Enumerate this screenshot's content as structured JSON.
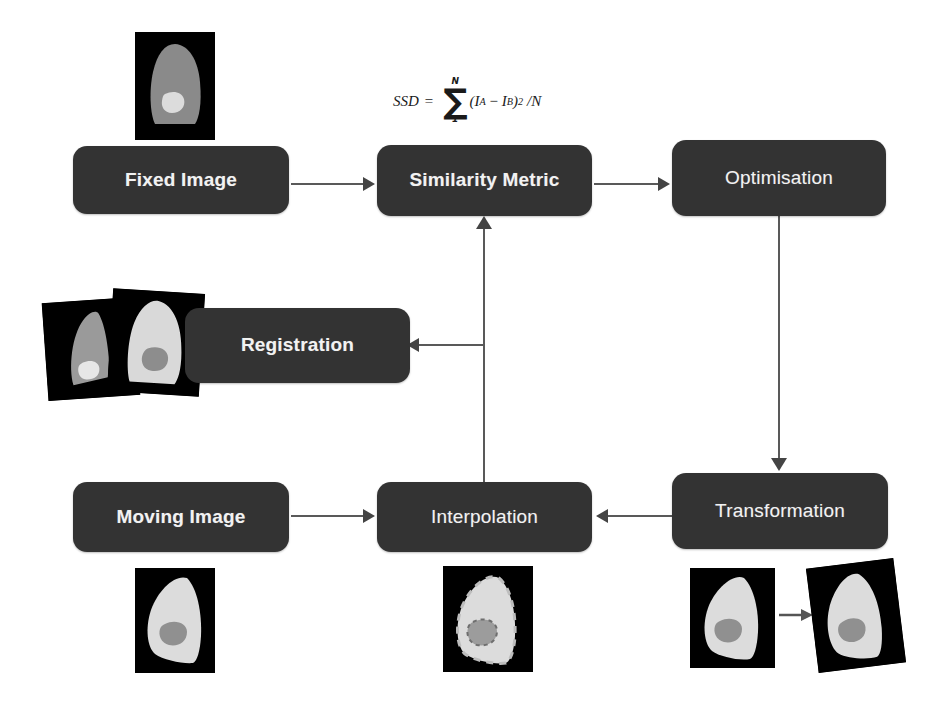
{
  "diagram": {
    "box_color": "#333333",
    "text_color": "#f2f2f2",
    "connector_color": "#595959",
    "background": "#ffffff"
  },
  "nodes": [
    {
      "id": "fixed",
      "label": "Fixed Image"
    },
    {
      "id": "similarity",
      "label": "Similarity Metric"
    },
    {
      "id": "optimisation",
      "label": "Optimisation"
    },
    {
      "id": "registration",
      "label": "Registration"
    },
    {
      "id": "moving",
      "label": "Moving Image"
    },
    {
      "id": "interpolation",
      "label": "Interpolation"
    },
    {
      "id": "transformation",
      "label": "Transformation"
    }
  ],
  "formula": {
    "lhs": "SSD",
    "equals": "=",
    "sigma": "∑",
    "upper_limit": "N",
    "lower_limit": "1",
    "body_open": "(",
    "term_a": "I",
    "term_a_sub": "A",
    "minus": "−",
    "term_b": "I",
    "term_b_sub": "B",
    "body_close": ")",
    "power": "2",
    "divide": "/N"
  },
  "thumbnails": [
    {
      "id": "fixed-image-thumb",
      "caption": "fixed image scan"
    },
    {
      "id": "registration-overlay-thumb",
      "caption": "registered overlay pair"
    },
    {
      "id": "moving-image-thumb",
      "caption": "moving image scan"
    },
    {
      "id": "interpolation-thumb",
      "caption": "interpolated image"
    },
    {
      "id": "transformation-thumb",
      "caption": "image before and after transformation"
    }
  ],
  "edges": [
    {
      "from": "fixed",
      "to": "similarity",
      "direction": "right"
    },
    {
      "from": "similarity",
      "to": "optimisation",
      "direction": "right"
    },
    {
      "from": "optimisation",
      "to": "transformation",
      "direction": "down"
    },
    {
      "from": "transformation",
      "to": "interpolation",
      "direction": "left"
    },
    {
      "from": "moving",
      "to": "interpolation",
      "direction": "right"
    },
    {
      "from": "interpolation",
      "to": "similarity",
      "direction": "up"
    },
    {
      "from": "interpolation",
      "to": "registration",
      "direction": "left"
    }
  ]
}
